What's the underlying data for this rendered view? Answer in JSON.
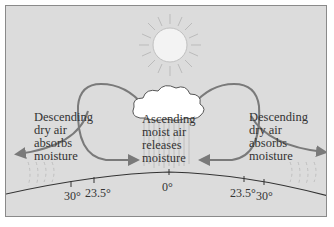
{
  "diagram": {
    "title": "",
    "labels": {
      "left": [
        "Descending",
        "dry air",
        "absorbs",
        "moisture"
      ],
      "center": [
        "Ascending",
        "moist air",
        "releases",
        "moisture"
      ],
      "right": [
        "Descending",
        "dry air",
        "absorbs",
        "moisture"
      ]
    },
    "latitude_ticks": {
      "left_30": "30°",
      "left_23_5": "23.5°",
      "equator": "0°",
      "right_23_5": "23.5°",
      "right_30": "30°"
    },
    "icons": [
      "sun-icon",
      "cloud-icon",
      "rain-streaks",
      "circulation-arrows",
      "earth-surface-curve"
    ],
    "colors": {
      "background": "#dcdcdc",
      "arrow": "#7a7a7a",
      "text": "#333333",
      "sun": "#f5f5f5",
      "cloud": "#ffffff",
      "ground_line": "#333333"
    }
  }
}
